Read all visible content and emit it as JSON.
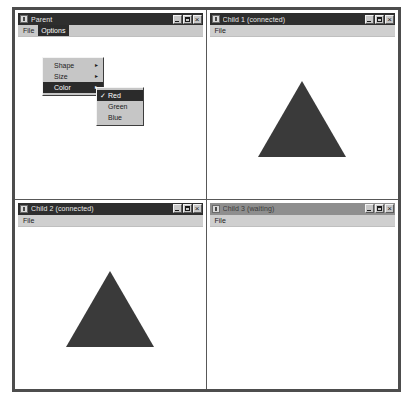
{
  "app": {
    "style": "mdi-windows-classic",
    "accent_titlebar": "#2e2e2e",
    "accent_titlebar_inactive": "#8e8e8e",
    "shape_color": "#3a3a3a"
  },
  "parent_window": {
    "title": "Parent",
    "icon": "app-icon",
    "menubar": [
      {
        "label": "File",
        "selected": false
      },
      {
        "label": "Options",
        "selected": true
      }
    ],
    "buttons": {
      "minimize": "minimize-icon",
      "maximize": "maximize-icon",
      "close": "close-icon"
    }
  },
  "options_menu": {
    "items": [
      {
        "label": "Shape",
        "submenu": true,
        "arrow": "▸",
        "highlight": false
      },
      {
        "label": "Size",
        "submenu": true,
        "arrow": "▸",
        "highlight": false
      },
      {
        "label": "Color",
        "submenu": true,
        "arrow": "▸",
        "highlight": true
      }
    ]
  },
  "color_menu": {
    "items": [
      {
        "label": "Red",
        "checked": true,
        "check": "✓",
        "highlight": true
      },
      {
        "label": "Green",
        "checked": false,
        "check": "",
        "highlight": false
      },
      {
        "label": "Blue",
        "checked": false,
        "check": "",
        "highlight": false
      }
    ]
  },
  "child1": {
    "title": "Child 1  (connected)",
    "active": true,
    "menubar": [
      {
        "label": "File"
      }
    ],
    "shape": "triangle",
    "buttons": {
      "minimize": "minimize-icon",
      "maximize": "maximize-icon",
      "close": "close-icon"
    }
  },
  "child2": {
    "title": "Child 2  (connected)",
    "active": true,
    "menubar": [
      {
        "label": "File"
      }
    ],
    "shape": "triangle",
    "buttons": {
      "minimize": "minimize-icon",
      "maximize": "maximize-icon",
      "close": "close-icon"
    }
  },
  "child3": {
    "title": "Child 3  (waiting)",
    "active": false,
    "menubar": [
      {
        "label": "File"
      }
    ],
    "shape": "none",
    "buttons": {
      "minimize": "minimize-icon",
      "maximize": "maximize-icon",
      "close": "close-icon"
    }
  }
}
